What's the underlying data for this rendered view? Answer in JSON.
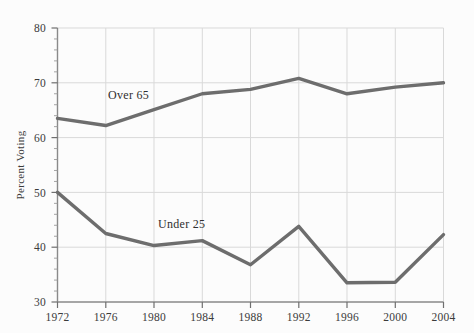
{
  "chart_data": {
    "type": "line",
    "title": "",
    "subtitle": "",
    "xlabel": "",
    "ylabel": "Percent Voting",
    "x": [
      1972,
      1976,
      1980,
      1984,
      1988,
      1992,
      1996,
      2000,
      2004
    ],
    "categories": [
      "1972",
      "1976",
      "1980",
      "1984",
      "1988",
      "1992",
      "1996",
      "2000",
      "2004"
    ],
    "series": [
      {
        "name": "Over 65",
        "values": [
          63.5,
          62.2,
          65.1,
          68.0,
          68.8,
          70.8,
          68.0,
          69.2,
          70.0
        ],
        "color": "#6d6d6d",
        "annotation": "Over 65"
      },
      {
        "name": "Under 25",
        "values": [
          50.0,
          42.5,
          40.3,
          41.2,
          36.8,
          43.8,
          33.5,
          33.6,
          42.3
        ],
        "color": "#6d6d6d",
        "annotation": "Under 25"
      }
    ],
    "ylim": [
      30,
      80
    ],
    "yticks": [
      30,
      40,
      50,
      60,
      70,
      80
    ],
    "ytick_labels": [
      "30",
      "40",
      "50",
      "60",
      "70",
      "80"
    ],
    "yminor_step": 2,
    "xlim": [
      1972,
      2004
    ],
    "grid": {
      "x": true,
      "y": true,
      "color": "#d7d7d7"
    },
    "legend": {
      "position": "inline-annotation",
      "entries": [
        "Over 65",
        "Under 25"
      ]
    },
    "annotations": [
      {
        "text": "Over 65",
        "x_px": 108,
        "y_px": 98
      },
      {
        "text": "Under 25",
        "x_px": 158,
        "y_px": 227
      }
    ],
    "axis_color": "#8a8a8a",
    "line_width_px": 3.4
  },
  "axis": {
    "y_title": "Percent Voting"
  }
}
